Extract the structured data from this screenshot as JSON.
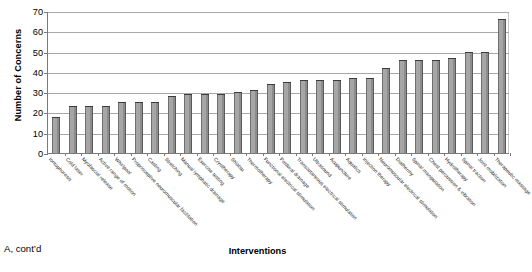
{
  "chart_data": {
    "type": "bar",
    "title": "",
    "xlabel": "Interventions",
    "ylabel": "Number of Concerns",
    "ylim": [
      0,
      70
    ],
    "yticks": [
      0,
      10,
      20,
      30,
      40,
      50,
      60,
      70
    ],
    "grid": true,
    "legend": "none",
    "bar_color": "#a6a6a6",
    "categories": [
      "Iontophoresis",
      "Cold laser",
      "Myofascial release",
      "Active range of motion",
      "Whirlpool",
      "Proprioceptive neuromuscular facilitation",
      "Casting",
      "Stretching",
      "Manual lymphatic drainage",
      "Exercise testing",
      "Cryotherapy",
      "Shiatsu",
      "Thermotherapy",
      "Functional electrical stimulation",
      "Postural drainage",
      "Transcutaneous electrical stimulation",
      "Ultrasound",
      "Acupuncture",
      "Aquatics",
      "Injection therapy",
      "Neuromuscular electrical stimulation",
      "Diathermy",
      "Spinal manipulation",
      "Chest percussion & vibration",
      "Hydrotherapy",
      "Spinal traction",
      "Joint mobilization",
      "Therapeutic massage"
    ],
    "values": [
      18,
      23,
      23,
      23,
      25,
      25,
      25,
      28,
      29,
      29,
      29,
      30,
      31,
      34,
      35,
      36,
      36,
      36,
      37,
      37,
      42,
      46,
      46,
      46,
      47,
      50,
      50,
      66
    ]
  },
  "caption": {
    "text": "A, cont’d"
  }
}
